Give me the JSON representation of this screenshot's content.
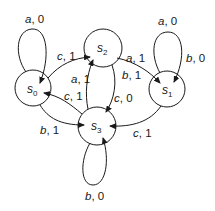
{
  "diagram": {
    "type": "finite-state-machine",
    "states": [
      {
        "id": "s0",
        "name": "s",
        "sub": "0"
      },
      {
        "id": "s1",
        "name": "s",
        "sub": "1"
      },
      {
        "id": "s2",
        "name": "s",
        "sub": "2"
      },
      {
        "id": "s3",
        "name": "s",
        "sub": "3"
      }
    ],
    "edges": [
      {
        "from": "s0",
        "to": "s0",
        "label": "a, 0"
      },
      {
        "from": "s0",
        "to": "s2",
        "label": "c, 1"
      },
      {
        "from": "s3",
        "to": "s0",
        "label": "c, 1"
      },
      {
        "from": "s0",
        "to": "s3",
        "label": "b, 1"
      },
      {
        "from": "s2",
        "to": "s1",
        "label_top": "a, 1",
        "label_bottom": "b, 1"
      },
      {
        "from": "s1",
        "to": "s1",
        "label_top": "a, 0",
        "label_side": "b, 0"
      },
      {
        "from": "s3",
        "to": "s2",
        "label": "a, 1"
      },
      {
        "from": "s2",
        "to": "s3",
        "label": "c, 0"
      },
      {
        "from": "s1",
        "to": "s3",
        "label": "c, 1"
      },
      {
        "from": "s3",
        "to": "s3",
        "label": "b, 0"
      }
    ],
    "labels": {
      "s0_loop": {
        "sym": "a",
        "out": "0"
      },
      "s0_s2": {
        "sym": "c",
        "out": "1"
      },
      "s3_s0": {
        "sym": "c",
        "out": "1"
      },
      "s0_s3": {
        "sym": "b",
        "out": "1"
      },
      "s2_s1_a": {
        "sym": "a",
        "out": "1"
      },
      "s2_s1_b": {
        "sym": "b",
        "out": "1"
      },
      "s1_loop_a": {
        "sym": "a",
        "out": "0"
      },
      "s1_loop_b": {
        "sym": "b",
        "out": "0"
      },
      "s3_s2": {
        "sym": "a",
        "out": "1"
      },
      "s2_s3": {
        "sym": "c",
        "out": "0"
      },
      "s1_s3": {
        "sym": "c",
        "out": "1"
      },
      "s3_loop": {
        "sym": "b",
        "out": "0"
      }
    }
  }
}
